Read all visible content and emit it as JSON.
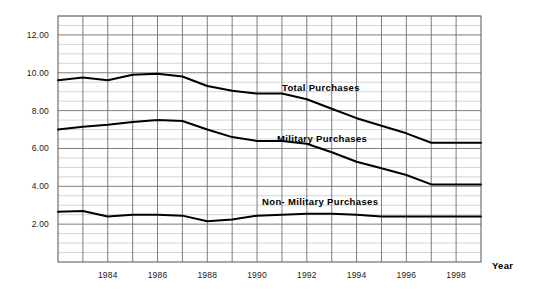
{
  "chart_data": {
    "type": "line",
    "title": "",
    "xlabel": "Year",
    "ylabel": "",
    "grid": true,
    "legend_position": "inline-annotations",
    "xlim": [
      1982,
      1999
    ],
    "ylim": [
      0,
      13
    ],
    "y_major_ticks": [
      "2.00",
      "4.00",
      "6.00",
      "8.00",
      "10.00",
      "12.00"
    ],
    "y_major_values": [
      2,
      4,
      6,
      8,
      10,
      12
    ],
    "y_minor_step": 0.5,
    "x_tick_labels": [
      "1984",
      "1986",
      "1988",
      "1990",
      "1992",
      "1994",
      "1996",
      "1998"
    ],
    "x_tick_values": [
      1984,
      1986,
      1988,
      1990,
      1992,
      1994,
      1996,
      1998
    ],
    "x_gridline_values": [
      1983,
      1984,
      1985,
      1986,
      1987,
      1988,
      1989,
      1990,
      1991,
      1992,
      1993,
      1994,
      1995,
      1996,
      1997,
      1998
    ],
    "x": [
      1982,
      1983,
      1984,
      1985,
      1986,
      1987,
      1988,
      1989,
      1990,
      1991,
      1992,
      1993,
      1994,
      1995,
      1996,
      1997,
      1998,
      1999
    ],
    "series": [
      {
        "name": "Total Purchases",
        "color": "#000000",
        "label_x": 1991.0,
        "label_y": 9.05,
        "values": [
          9.6,
          9.75,
          9.6,
          9.9,
          9.95,
          9.8,
          9.3,
          9.05,
          8.9,
          8.9,
          8.6,
          8.1,
          7.6,
          7.2,
          6.8,
          6.3,
          6.3,
          6.3
        ]
      },
      {
        "name": "Military Purchases",
        "color": "#000000",
        "label_x": 1990.8,
        "label_y": 6.35,
        "values": [
          7.0,
          7.15,
          7.25,
          7.4,
          7.5,
          7.45,
          7.0,
          6.6,
          6.4,
          6.4,
          6.25,
          5.8,
          5.3,
          4.95,
          4.6,
          4.1,
          4.1,
          4.1
        ]
      },
      {
        "name": "Non- Military Purchases",
        "color": "#000000",
        "label_x": 1990.2,
        "label_y": 3.0,
        "values": [
          2.65,
          2.7,
          2.4,
          2.5,
          2.5,
          2.45,
          2.15,
          2.25,
          2.45,
          2.5,
          2.55,
          2.55,
          2.5,
          2.4,
          2.4,
          2.4,
          2.4,
          2.4
        ]
      }
    ]
  },
  "colors": {
    "line": "#000000",
    "border": "#555555",
    "grid_major": "#6f6f6f",
    "grid_minor": "#c9c9c9",
    "text": "#1a1a1a",
    "background": "#ffffff"
  }
}
